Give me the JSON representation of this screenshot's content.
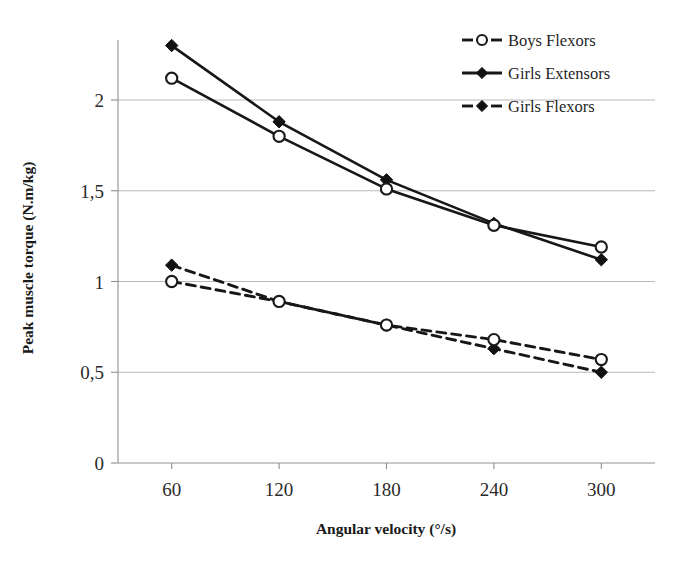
{
  "chart_data": {
    "type": "line",
    "title": "",
    "xlabel": "Angular velocity (°/s)",
    "ylabel": "Peak muscle torque (N.m/kg)",
    "categories": [
      "60",
      "120",
      "180",
      "240",
      "300"
    ],
    "x": [
      60,
      120,
      180,
      240,
      300
    ],
    "xlim": [
      30,
      330
    ],
    "ylim": [
      0,
      2.45
    ],
    "ytick_labels": [
      "0",
      "0,5",
      "1",
      "1,5",
      "2"
    ],
    "ytick_values": [
      0,
      0.5,
      1,
      1.5,
      2
    ],
    "xtick_labels": [
      "60",
      "120",
      "180",
      "240",
      "300"
    ],
    "grid": "horizontal",
    "legend_position": "top-right",
    "decimal_separator": ",",
    "series": [
      {
        "name": "Girls Extensors",
        "values": [
          2.3,
          1.88,
          1.56,
          1.32,
          1.12
        ],
        "line_style": "solid",
        "marker": "filled-diamond",
        "color": "#171717",
        "in_legend": true
      },
      {
        "name": "Boys Extensors",
        "values": [
          2.12,
          1.8,
          1.51,
          1.31,
          1.19
        ],
        "line_style": "solid",
        "marker": "open-circle",
        "color": "#171717",
        "in_legend": false
      },
      {
        "name": "Girls Flexors",
        "values": [
          1.09,
          0.89,
          0.76,
          0.63,
          0.5
        ],
        "line_style": "dashed",
        "marker": "filled-diamond",
        "color": "#171717",
        "in_legend": true
      },
      {
        "name": "Boys Flexors",
        "values": [
          1.0,
          0.89,
          0.76,
          0.68,
          0.57
        ],
        "line_style": "dashed",
        "marker": "open-circle",
        "color": "#171717",
        "in_legend": false
      }
    ],
    "legend_entries": [
      {
        "label": "Boys Flexors",
        "line_style": "dashed",
        "marker": "open-circle"
      },
      {
        "label": "Girls Extensors",
        "line_style": "solid",
        "marker": "filled-diamond"
      },
      {
        "label": "Girls Flexors",
        "line_style": "dashed",
        "marker": "filled-diamond"
      }
    ]
  }
}
